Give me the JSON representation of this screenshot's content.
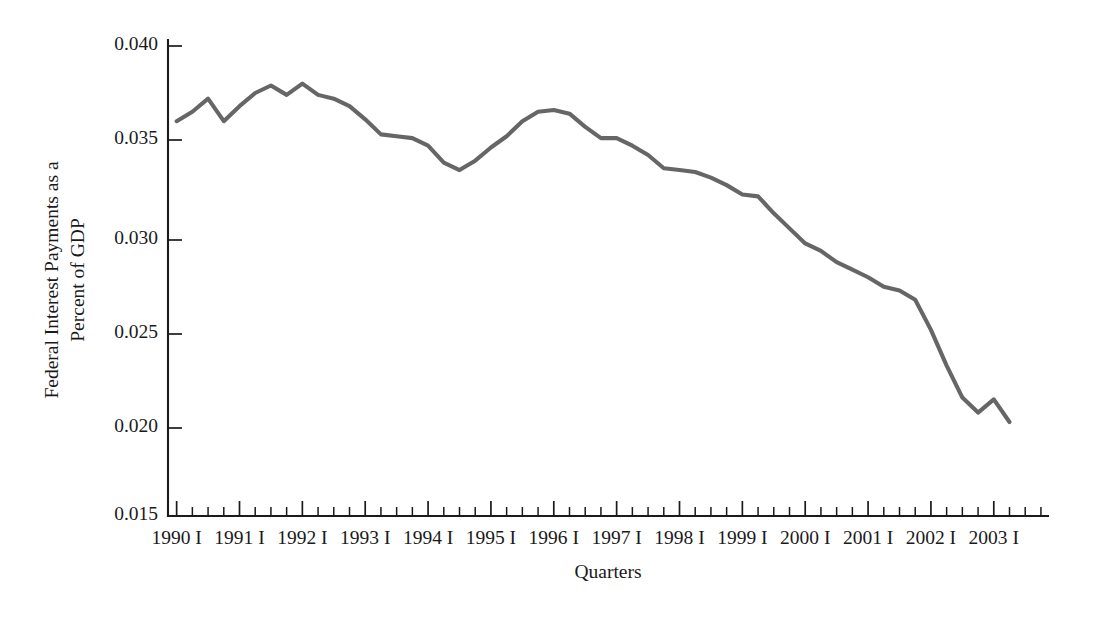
{
  "chart_data": {
    "type": "line",
    "title": "",
    "xlabel": "Quarters",
    "ylabel": "Federal Interest Payments as a Percent of GDP",
    "ylabel_lines": [
      "Federal Interest Payments as a",
      "Percent of GDP"
    ],
    "ylim": [
      0.015,
      0.04
    ],
    "ytick_labels": [
      "0.015",
      "0.020",
      "0.025",
      "0.030",
      "0.035",
      "0.040"
    ],
    "ytick_values": [
      0.015,
      0.02,
      0.025,
      0.03,
      0.035,
      0.04
    ],
    "xtick_labels": [
      "1990 I",
      "1991 I",
      "1992 I",
      "1993 I",
      "1994 I",
      "1995 I",
      "1996 I",
      "1997 I",
      "1998 I",
      "1999 I",
      "2000 I",
      "2001 I",
      "2002 I",
      "2003 I"
    ],
    "grid": false,
    "legend": false,
    "legend_position": "none",
    "line_color": "#666666",
    "axis_color": "#1a1a1a",
    "background_color": "#ffffff",
    "x_minor_ticks_per_label": 4,
    "x_quarter_labels": [
      "I",
      "II",
      "III",
      "IV"
    ],
    "series": [
      {
        "name": "Federal Interest Payments as a Percent of GDP",
        "x": [
          "1990 I",
          "1990 II",
          "1990 III",
          "1990 IV",
          "1991 I",
          "1991 II",
          "1991 III",
          "1991 IV",
          "1992 I",
          "1992 II",
          "1992 III",
          "1992 IV",
          "1993 I",
          "1993 II",
          "1993 III",
          "1993 IV",
          "1994 I",
          "1994 II",
          "1994 III",
          "1994 IV",
          "1995 I",
          "1995 II",
          "1995 III",
          "1995 IV",
          "1996 I",
          "1996 II",
          "1996 III",
          "1996 IV",
          "1997 I",
          "1997 II",
          "1997 III",
          "1997 IV",
          "1998 I",
          "1998 II",
          "1998 III",
          "1998 IV",
          "1999 I",
          "1999 II",
          "1999 III",
          "1999 IV",
          "2000 I",
          "2000 II",
          "2000 III",
          "2000 IV",
          "2001 I",
          "2001 II",
          "2001 III",
          "2001 IV",
          "2002 I",
          "2002 II",
          "2002 III",
          "2002 IV",
          "2003 I",
          "2003 II"
        ],
        "values": [
          0.036,
          0.0365,
          0.0372,
          0.036,
          0.0368,
          0.0375,
          0.0379,
          0.0374,
          0.038,
          0.0374,
          0.0372,
          0.0368,
          0.0361,
          0.0353,
          0.0352,
          0.0351,
          0.0347,
          0.0338,
          0.0334,
          0.0339,
          0.0346,
          0.0352,
          0.036,
          0.0365,
          0.0366,
          0.0364,
          0.0357,
          0.0351,
          0.0351,
          0.0347,
          0.0342,
          0.0335,
          0.0334,
          0.0333,
          0.033,
          0.0326,
          0.0321,
          0.032,
          0.0311,
          0.0303,
          0.0295,
          0.0291,
          0.0285,
          0.0281,
          0.0277,
          0.0272,
          0.027,
          0.0265,
          0.0249,
          0.023,
          0.0213,
          0.0205,
          0.0212,
          0.02
        ],
        "color": "#666666"
      }
    ]
  },
  "axes": {
    "y_axis_name": "y-axis",
    "x_axis_name": "x-axis"
  }
}
